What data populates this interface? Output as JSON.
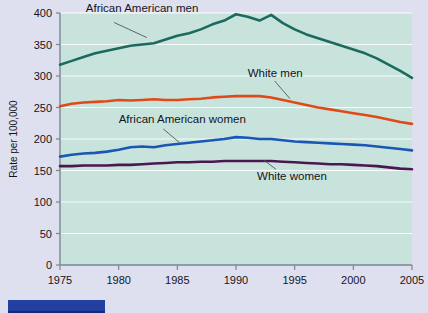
{
  "figure": {
    "background_color": "#dfe0ef",
    "plot_background_color": "#c8e3dc",
    "gridline_color": "#ffffff",
    "axis_color": "#7d8494"
  },
  "bottom_bar": {
    "color": "#2340a0"
  },
  "chart_data": {
    "type": "line",
    "title": "",
    "xlabel": "",
    "ylabel": "Rate per 100,000",
    "xlim": [
      1975,
      2005
    ],
    "ylim": [
      0,
      400
    ],
    "grid": true,
    "legend_position": "inline-annotations",
    "xticks": [
      1975,
      1980,
      1985,
      1990,
      1995,
      2000,
      2005
    ],
    "xtick_labels": [
      "1975",
      "1980",
      "1985",
      "1990",
      "1995",
      "2000",
      "2005"
    ],
    "yticks": [
      0,
      50,
      100,
      150,
      200,
      250,
      300,
      350,
      400
    ],
    "ytick_labels": [
      "0",
      "50",
      "100",
      "150",
      "200",
      "250",
      "300",
      "350",
      "400"
    ],
    "x": [
      1975,
      1976,
      1977,
      1978,
      1979,
      1980,
      1981,
      1982,
      1983,
      1984,
      1985,
      1986,
      1987,
      1988,
      1989,
      1990,
      1991,
      1992,
      1993,
      1994,
      1995,
      1996,
      1997,
      1998,
      1999,
      2000,
      2001,
      2002,
      2003,
      2004,
      2005
    ],
    "series": [
      {
        "name": "African American men",
        "color": "#1a6b5e",
        "label_x": 1977.2,
        "label_y": 408,
        "values": [
          318,
          324,
          330,
          336,
          340,
          344,
          348,
          350,
          352,
          358,
          364,
          368,
          374,
          382,
          388,
          398,
          394,
          388,
          397,
          384,
          374,
          366,
          360,
          354,
          348,
          342,
          336,
          328,
          318,
          308,
          297
        ]
      },
      {
        "name": "White men",
        "color": "#e04a18",
        "label_x": 1991.0,
        "label_y": 304,
        "values": [
          252,
          256,
          258,
          259,
          260,
          262,
          261,
          262,
          263,
          262,
          262,
          263,
          264,
          266,
          267,
          268,
          268,
          268,
          266,
          262,
          258,
          254,
          250,
          247,
          244,
          241,
          238,
          235,
          231,
          227,
          224
        ]
      },
      {
        "name": "African American women",
        "color": "#1a57b5",
        "label_x": 1980.0,
        "label_y": 232,
        "values": [
          172,
          175,
          177,
          178,
          180,
          183,
          187,
          188,
          187,
          190,
          192,
          194,
          196,
          198,
          200,
          203,
          202,
          200,
          200,
          198,
          196,
          195,
          194,
          193,
          192,
          191,
          190,
          188,
          186,
          184,
          182
        ]
      },
      {
        "name": "White women",
        "color": "#4a1752",
        "label_x": 1991.8,
        "label_y": 142,
        "values": [
          157,
          157,
          158,
          158,
          158,
          159,
          159,
          160,
          161,
          162,
          163,
          163,
          164,
          164,
          165,
          165,
          165,
          165,
          165,
          164,
          163,
          162,
          161,
          160,
          160,
          159,
          158,
          157,
          155,
          153,
          152
        ]
      }
    ],
    "annotations": [
      {
        "text": "African American men",
        "leader_from": [
          1979.6,
          385
        ],
        "leader_to": [
          1982.4,
          361
        ]
      },
      {
        "text": "White men",
        "leader_from": [
          1993.3,
          292
        ],
        "leader_to": [
          1994.6,
          264
        ]
      },
      {
        "text": "African American women",
        "leader_from": [
          1983.8,
          216
        ],
        "leader_to": [
          1985.2,
          194
        ]
      },
      {
        "text": "White women",
        "leader_from": [
          1993.4,
          152
        ],
        "leader_to": [
          1992.4,
          166
        ]
      }
    ]
  }
}
